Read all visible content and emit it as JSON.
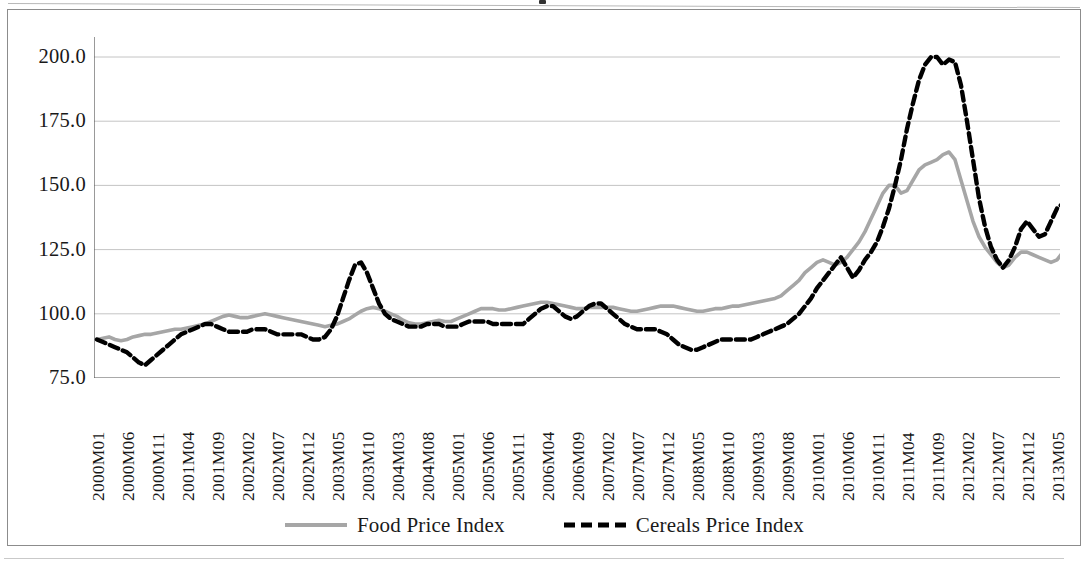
{
  "figure": {
    "background_color": "#ffffff",
    "border_color": "#8c8c8c"
  },
  "legend": {
    "position": "bottom-center",
    "entries": [
      {
        "label": "Food Price Index",
        "color": "#a6a6a6",
        "style": "solid",
        "swatch_name": "legend-swatch-food"
      },
      {
        "label": "Cereals Price Index",
        "color": "#000000",
        "style": "dashed",
        "swatch_name": "legend-swatch-cereals"
      }
    ]
  },
  "axes": {
    "y": {
      "min": 75.0,
      "max": 200.0,
      "step": 25.0,
      "ticks": [
        "200.0",
        "175.0",
        "150.0",
        "125.0",
        "100.0",
        "75.0"
      ],
      "gridlines": true
    },
    "x": {
      "label_interval_months": 5,
      "first_label": "2000M01",
      "last_label": "2013M05",
      "ticks": [
        "2000M01",
        "2000M06",
        "2000M11",
        "2001M04",
        "2001M09",
        "2002M02",
        "2002M07",
        "2002M12",
        "2003M05",
        "2003M10",
        "2004M03",
        "2004M08",
        "2005M01",
        "2005M06",
        "2005M11",
        "2006M04",
        "2006M09",
        "2007M02",
        "2007M07",
        "2007M12",
        "2008M05",
        "2008M10",
        "2009M03",
        "2009M08",
        "2010M01",
        "2010M06",
        "2010M11",
        "2011M04",
        "2011M09",
        "2012M02",
        "2012M07",
        "2012M12",
        "2013M05"
      ]
    }
  },
  "chart_data": {
    "type": "line",
    "title": "",
    "subtitle": "",
    "xlabel": "",
    "ylabel": "",
    "ylim": [
      75.0,
      200.0
    ],
    "ytick_step": 25.0,
    "grid": true,
    "legend_position": "bottom",
    "x_start": "2000M01",
    "x_end": "2013M05",
    "x_count": 161,
    "series": [
      {
        "name": "Food Price Index",
        "color": "#a6a6a6",
        "style": "solid",
        "values": [
          90,
          90.5,
          91,
          90,
          89.5,
          90,
          91,
          91.5,
          92,
          92,
          92.5,
          93,
          93.5,
          94,
          94,
          94.5,
          95,
          95.5,
          96,
          97,
          98,
          99,
          99.5,
          99,
          98.5,
          98.5,
          99,
          99.5,
          100,
          99.5,
          99,
          98.5,
          98,
          97.5,
          97,
          96.5,
          96,
          95.5,
          95,
          95.5,
          96,
          97,
          98,
          99.5,
          101,
          102,
          102.5,
          102,
          101,
          100,
          99,
          97.5,
          96.5,
          96,
          96,
          96.5,
          97,
          97.5,
          97,
          97,
          98,
          99,
          100,
          101,
          102,
          102,
          102,
          101.5,
          101.5,
          102,
          102.5,
          103,
          103.5,
          104,
          104.5,
          104.5,
          104,
          103.5,
          103,
          102.5,
          102,
          102,
          102.5,
          102.5,
          102.5,
          102.5,
          102.5,
          102,
          101.5,
          101,
          101,
          101.5,
          102,
          102.5,
          103,
          103,
          103,
          102.5,
          102,
          101.5,
          101,
          101,
          101.5,
          102,
          102,
          102.5,
          103,
          103,
          103.5,
          104,
          104.5,
          105,
          105.5,
          106,
          107,
          109,
          111,
          113,
          116,
          118,
          120,
          121,
          120,
          119,
          120,
          122,
          125,
          128,
          132,
          137,
          142,
          147,
          150,
          150,
          147,
          148,
          152,
          156,
          158,
          159,
          160,
          162,
          163,
          160,
          152,
          144,
          136,
          130,
          126,
          123,
          120,
          118,
          119,
          122,
          124,
          124,
          123,
          122,
          121,
          120,
          121,
          124,
          128,
          133,
          138,
          135,
          133,
          132,
          128,
          125,
          124,
          124,
          125,
          125,
          127,
          131,
          140,
          150,
          158,
          160,
          158,
          156,
          155,
          155,
          155,
          154,
          152,
          150,
          148,
          146,
          144,
          142,
          141,
          140,
          140,
          142,
          144,
          145,
          145,
          144,
          142,
          140,
          139,
          137,
          136,
          134,
          132,
          131,
          132,
          135,
          138,
          139,
          139,
          138,
          138,
          139,
          139,
          140,
          140,
          140,
          140,
          140
        ]
      },
      {
        "name": "Cereals Price Index",
        "color": "#000000",
        "style": "dashed",
        "values": [
          90,
          89,
          88,
          87,
          86,
          85,
          83,
          81,
          80,
          82,
          84,
          86,
          88,
          90,
          92,
          93,
          94,
          95,
          96,
          96,
          95,
          94,
          93,
          93,
          93,
          93,
          94,
          94,
          94,
          93,
          92,
          92,
          92,
          92,
          92,
          91,
          90,
          90,
          91,
          94,
          99,
          106,
          113,
          119,
          120,
          116,
          110,
          104,
          100,
          98,
          97,
          96,
          95,
          95,
          95,
          96,
          96,
          96,
          95,
          95,
          95,
          96,
          97,
          97,
          97,
          97,
          96,
          96,
          96,
          96,
          96,
          96,
          98,
          100,
          102,
          103,
          103,
          101,
          99,
          98,
          99,
          101,
          103,
          104,
          104,
          102,
          100,
          98,
          96,
          95,
          94,
          94,
          94,
          94,
          93,
          92,
          90,
          88,
          87,
          86,
          86,
          87,
          88,
          89,
          90,
          90,
          90,
          90,
          90,
          90,
          91,
          92,
          93,
          94,
          95,
          96,
          98,
          100,
          103,
          106,
          110,
          113,
          116,
          119,
          122,
          118,
          114,
          117,
          121,
          124,
          128,
          134,
          141,
          150,
          160,
          172,
          182,
          191,
          197,
          200,
          200,
          197,
          199,
          198,
          189,
          175,
          160,
          145,
          134,
          126,
          121,
          118,
          121,
          126,
          133,
          136,
          133,
          130,
          131,
          136,
          141,
          143,
          142,
          138,
          133,
          128,
          124,
          122,
          120,
          117,
          115,
          113,
          112,
          113,
          118,
          126,
          140,
          155,
          168,
          174,
          177,
          173,
          168,
          166,
          170,
          175,
          177,
          175,
          170,
          163,
          155,
          148,
          142,
          138,
          138,
          140,
          141,
          140,
          139,
          138,
          138,
          139,
          139,
          139,
          138,
          136,
          134,
          133,
          137,
          148,
          163,
          172,
          174,
          172,
          170,
          169,
          167,
          165,
          162,
          159,
          157,
          156
        ]
      }
    ]
  }
}
